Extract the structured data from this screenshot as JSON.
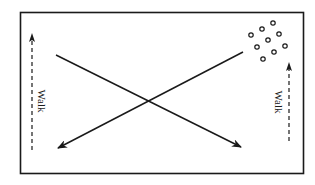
{
  "diagram": {
    "labels": {
      "left_walk": "Walk",
      "right_walk": "Walk"
    },
    "players_group": {
      "count": 9,
      "location": "top-right corner"
    },
    "paths": [
      {
        "name": "diagonal-run-left-to-right",
        "style": "solid",
        "direction": "top-left to bottom-right"
      },
      {
        "name": "diagonal-run-right-to-left",
        "style": "solid",
        "direction": "top-right to bottom-left"
      },
      {
        "name": "walk-left",
        "style": "dashed",
        "direction": "upward"
      },
      {
        "name": "walk-right",
        "style": "dashed",
        "direction": "upward"
      }
    ],
    "colors": {
      "ink": "#1a1a1a",
      "background": "#ffffff"
    }
  }
}
